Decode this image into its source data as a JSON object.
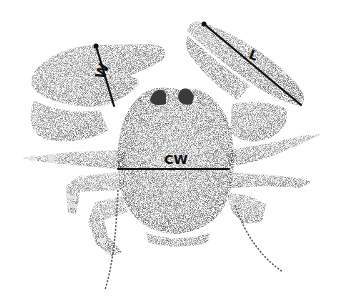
{
  "figure": {
    "background": "#ffffff",
    "ink": "#1a1a1a",
    "labels": {
      "chela_width": "W",
      "chela_length": "L",
      "carapace_width": "CW"
    },
    "measurement_lines": [
      {
        "name": "chela-width-line",
        "label": "W",
        "x1": 96,
        "y1": 46,
        "x2": 114,
        "y2": 106
      },
      {
        "name": "chela-length-line",
        "label": "L",
        "x1": 204,
        "y1": 24,
        "x2": 301,
        "y2": 105
      },
      {
        "name": "carapace-width-line",
        "label": "CW",
        "x1": 118,
        "y1": 169,
        "x2": 229,
        "y2": 169
      }
    ]
  }
}
